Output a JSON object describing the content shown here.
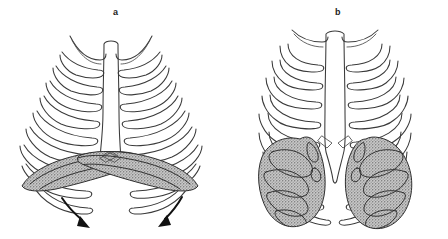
{
  "figure": {
    "kind": "anatomical-line-drawing",
    "background_color": "#ffffff",
    "line_color": "#3a3a3a",
    "shading_color": "#a9a9a9",
    "arrow_color": "#111111",
    "width": 448,
    "height": 239
  },
  "panels": [
    {
      "id": "a",
      "label": "a",
      "label_x": 113,
      "label_y": 8,
      "description": "hyperinflated barrel chest with flattened low diaphragm",
      "rib_pairs": 9,
      "diaphragm_shape": "flattened",
      "arrows": 2,
      "arrow_direction": "downward-outward"
    },
    {
      "id": "b",
      "label": "b",
      "label_x": 335,
      "label_y": 8,
      "description": "normal chest with domed diaphragm",
      "rib_pairs": 9,
      "diaphragm_shape": "domed",
      "arrows": 0
    }
  ]
}
